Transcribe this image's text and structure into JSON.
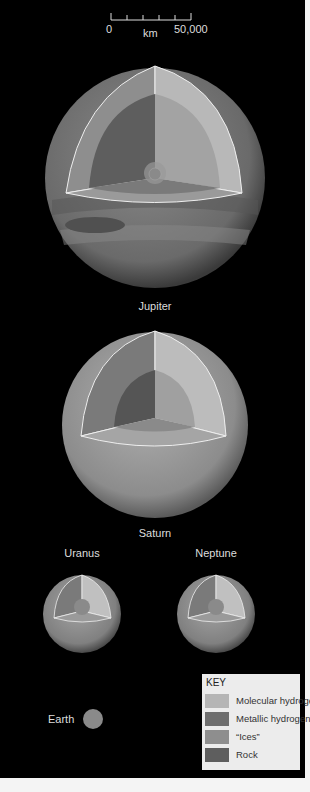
{
  "scale": {
    "start": "0",
    "end": "50,000",
    "unit": "km",
    "ticks": 6
  },
  "planets": [
    {
      "name": "Jupiter"
    },
    {
      "name": "Saturn"
    },
    {
      "name": "Uranus"
    },
    {
      "name": "Neptune"
    },
    {
      "name": "Earth"
    }
  ],
  "key": {
    "title": "KEY",
    "items": [
      {
        "label": "Molecular hydrogen",
        "color": "#b5b5b5"
      },
      {
        "label": "Metallic hydrogen",
        "color": "#6e6e6e"
      },
      {
        "label": "“Ices”",
        "color": "#8e8e8e"
      },
      {
        "label": "Rock",
        "color": "#5e5e5e"
      }
    ]
  },
  "colors": {
    "background": "#000000",
    "mol_h": "#b5b5b5",
    "met_h": "#6e6e6e",
    "ices": "#8e8e8e",
    "rock": "#5e5e5e"
  }
}
